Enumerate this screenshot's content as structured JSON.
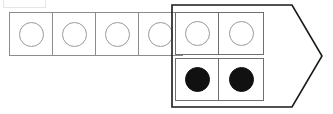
{
  "diagram": {
    "title": "Cell strip with arrow-shaped block",
    "background_color": "#ffffff",
    "canvas": {
      "width": 333,
      "height": 114
    },
    "palette": {
      "strip_border": "#8c8c8c",
      "block_border": "#6e6e6e",
      "arrow_border": "#1a1a1a",
      "ring_stroke": "#9a9a9a",
      "filled_dot": "#111111",
      "fragment_border": "#e6e6e6"
    },
    "top_fragment": {
      "label": "cut-off-element",
      "visible": true
    },
    "strip": {
      "label": "cell-strip",
      "cell_count": 4,
      "cells": [
        {
          "index": 1,
          "marker": "ring",
          "filled": false
        },
        {
          "index": 2,
          "marker": "ring",
          "filled": false
        },
        {
          "index": 3,
          "marker": "ring",
          "filled": false
        },
        {
          "index": 4,
          "marker": "ring",
          "filled": false
        }
      ]
    },
    "arrow_block": {
      "label": "arrow-block",
      "shape": "pentagon-arrow-right",
      "points": "1,1 121,1 151,52 121,103 1,103",
      "rows": [
        {
          "index": 1,
          "name": "top-row",
          "cells": [
            {
              "index": 1,
              "marker": "ring",
              "filled": false
            },
            {
              "index": 2,
              "marker": "ring",
              "filled": false
            }
          ]
        },
        {
          "index": 2,
          "name": "bottom-row",
          "cells": [
            {
              "index": 1,
              "marker": "dot",
              "filled": true
            },
            {
              "index": 2,
              "marker": "dot",
              "filled": true
            }
          ]
        }
      ]
    }
  }
}
